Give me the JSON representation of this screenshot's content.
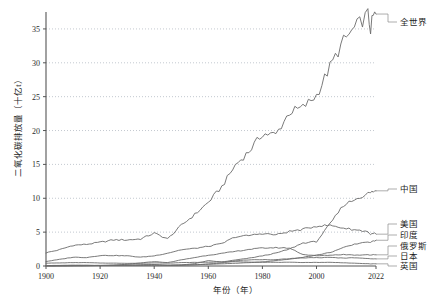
{
  "chart_data": {
    "type": "line",
    "title": "",
    "xlabel": "年份（年）",
    "ylabel": "二氧化碳排放量（十亿t）",
    "xlim": [
      1900,
      2022
    ],
    "ylim": [
      0,
      37.5
    ],
    "grid": true,
    "grid_style": "dotted-horizontal",
    "legend_position": "right-leader-lines",
    "xticks": [
      "1900",
      "1920",
      "1940",
      "1960",
      "1980",
      "2000",
      "2022"
    ],
    "xtick_values": [
      1900,
      1920,
      1940,
      1960,
      1980,
      2000,
      2022
    ],
    "yticks": [
      "0",
      "5",
      "10",
      "15",
      "20",
      "25",
      "30",
      "35"
    ],
    "ytick_values": [
      0,
      5,
      10,
      15,
      20,
      25,
      30,
      35
    ],
    "x": [
      1900,
      1905,
      1910,
      1915,
      1920,
      1925,
      1930,
      1935,
      1940,
      1945,
      1950,
      1955,
      1960,
      1965,
      1970,
      1975,
      1980,
      1985,
      1990,
      1995,
      2000,
      2005,
      2010,
      2015,
      2019,
      2020,
      2021,
      2022
    ],
    "series": [
      {
        "name": "全世界",
        "label": "全世界",
        "color": "#6b6b6b",
        "values": [
          1.95,
          2.4,
          3.05,
          3.2,
          3.5,
          3.85,
          3.85,
          4.0,
          4.85,
          4.0,
          6.0,
          7.6,
          9.4,
          11.7,
          14.9,
          16.9,
          19.5,
          19.4,
          22.7,
          23.4,
          25.2,
          29.4,
          33.2,
          35.5,
          37.1,
          35.0,
          36.8,
          37.2
        ]
      },
      {
        "name": "中国",
        "label": "中国",
        "color": "#6b6b6b",
        "values": [
          0.02,
          0.03,
          0.04,
          0.05,
          0.07,
          0.1,
          0.13,
          0.14,
          0.17,
          0.1,
          0.15,
          0.35,
          0.78,
          0.6,
          0.88,
          1.15,
          1.5,
          1.9,
          2.5,
          3.4,
          3.6,
          6.2,
          9.0,
          10.0,
          10.7,
          10.8,
          11.0,
          11.1
        ]
      },
      {
        "name": "美国",
        "label": "美国",
        "color": "#6b6b6b",
        "values": [
          0.67,
          0.97,
          1.3,
          1.25,
          1.55,
          1.55,
          1.5,
          1.3,
          1.5,
          1.9,
          2.4,
          2.6,
          2.9,
          3.3,
          4.3,
          4.5,
          4.8,
          4.6,
          5.1,
          5.4,
          5.9,
          6.0,
          5.6,
          5.3,
          5.1,
          4.6,
          4.9,
          4.7
        ]
      },
      {
        "name": "印度",
        "label": "印度",
        "color": "#6b6b6b",
        "values": [
          0.03,
          0.04,
          0.05,
          0.06,
          0.07,
          0.08,
          0.09,
          0.09,
          0.11,
          0.12,
          0.15,
          0.18,
          0.25,
          0.32,
          0.4,
          0.5,
          0.6,
          0.8,
          1.0,
          1.3,
          1.6,
          2.0,
          2.7,
          3.3,
          3.6,
          3.4,
          3.7,
          3.8
        ]
      },
      {
        "name": "俄罗斯",
        "label": "俄罗斯",
        "color": "#6b6b6b",
        "values": [
          0.07,
          0.09,
          0.12,
          0.12,
          0.08,
          0.12,
          0.25,
          0.45,
          0.65,
          0.5,
          0.9,
          1.25,
          1.6,
          1.85,
          2.15,
          2.45,
          2.65,
          2.7,
          2.65,
          1.7,
          1.5,
          1.6,
          1.7,
          1.6,
          1.7,
          1.6,
          1.7,
          1.65
        ]
      },
      {
        "name": "日本",
        "label": "日本",
        "color": "#6b6b6b",
        "values": [
          0.02,
          0.03,
          0.05,
          0.06,
          0.08,
          0.1,
          0.12,
          0.17,
          0.22,
          0.08,
          0.11,
          0.18,
          0.3,
          0.45,
          0.77,
          0.9,
          0.95,
          0.93,
          1.08,
          1.2,
          1.23,
          1.26,
          1.17,
          1.23,
          1.1,
          1.04,
          1.07,
          1.05
        ]
      },
      {
        "name": "英国",
        "label": "英国",
        "color": "#6b6b6b",
        "values": [
          0.42,
          0.45,
          0.5,
          0.5,
          0.44,
          0.42,
          0.4,
          0.4,
          0.46,
          0.43,
          0.5,
          0.53,
          0.56,
          0.59,
          0.63,
          0.58,
          0.56,
          0.54,
          0.55,
          0.52,
          0.53,
          0.54,
          0.48,
          0.39,
          0.34,
          0.31,
          0.33,
          0.32
        ]
      }
    ]
  },
  "axis": {
    "x_title": "年份（年）",
    "y_title": "二氧化碳排放量（十亿t）"
  },
  "labels": {
    "world": "全世界",
    "china": "中国",
    "usa": "美国",
    "india": "印度",
    "russia": "俄罗斯",
    "japan": "日本",
    "uk": "英国"
  }
}
